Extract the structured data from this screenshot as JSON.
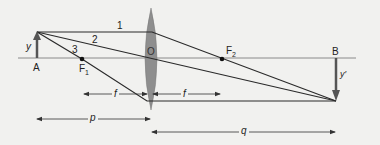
{
  "diagram": {
    "type": "thin converging lens ray diagram",
    "colors": {
      "background": "#f1f1ef",
      "rays": "#2a2a2a",
      "axis": "#8a8a8a",
      "lens": "#8e8e8e",
      "arrows": "#555555"
    },
    "labels": {
      "object_height": "y",
      "object_point": "A",
      "image_height": "y′",
      "image_point": "B",
      "lens_center": "O",
      "focal_point_1": "F",
      "focal_point_1_sub": "1",
      "focal_point_2": "F",
      "focal_point_2_sub": "2",
      "ray_1": "1",
      "ray_2": "2",
      "ray_3": "3",
      "focal_length_left": "f",
      "focal_length_right": "f",
      "object_distance": "p",
      "image_distance": "q"
    }
  }
}
